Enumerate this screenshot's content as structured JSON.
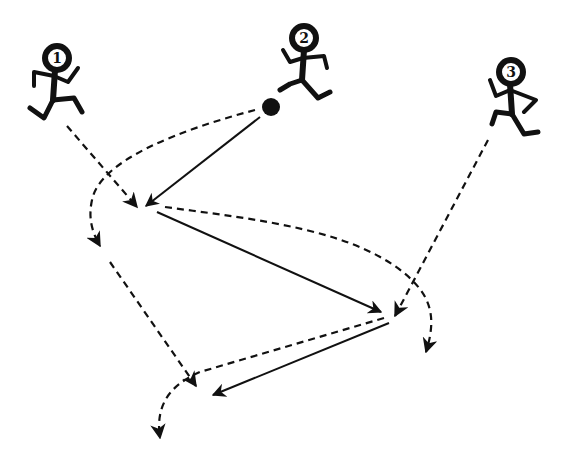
{
  "diagram": {
    "type": "sports-drill",
    "background": "#ffffff",
    "ink_color": "#111111",
    "players": [
      {
        "id": "1",
        "label": "1",
        "head": [
          57,
          58
        ]
      },
      {
        "id": "2",
        "label": "2",
        "head": [
          300,
          37
        ]
      },
      {
        "id": "3",
        "label": "3",
        "head": [
          511,
          72
        ]
      }
    ],
    "ball": {
      "center": [
        271,
        107
      ],
      "radius": 9
    },
    "legend": {
      "solid_arrow": "pass (ball path)",
      "dashed_arrow": "player run"
    },
    "paths": [
      {
        "id": "pass-2-to-1",
        "style": "solid",
        "from": "ball",
        "to": "spot-A"
      },
      {
        "id": "pass-1-to-3",
        "style": "solid",
        "from": "spot-A",
        "to": "spot-B"
      },
      {
        "id": "pass-3-to-1",
        "style": "solid",
        "from": "spot-B",
        "to": "spot-C"
      },
      {
        "id": "run-1-to-A",
        "style": "dashed",
        "from": "player-1",
        "to": "spot-A"
      },
      {
        "id": "run-2-overlap-left",
        "style": "dashed",
        "from": "player-2",
        "to": "left-curl"
      },
      {
        "id": "run-2-down-to-C",
        "style": "dashed",
        "from": "left-curl",
        "to": "spot-C"
      },
      {
        "id": "run-1-from-A-right",
        "style": "dashed",
        "from": "spot-A",
        "to": "right-curl"
      },
      {
        "id": "run-3-to-B",
        "style": "dashed",
        "from": "player-3",
        "to": "spot-B"
      },
      {
        "id": "run-3-from-B-to-C",
        "style": "dashed",
        "from": "spot-B",
        "to": "bottom-curl"
      }
    ]
  }
}
